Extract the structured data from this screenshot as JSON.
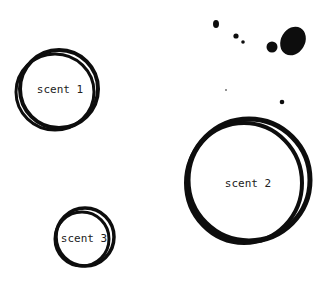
{
  "scents": [
    {
      "label": "scent 1"
    },
    {
      "label": "scent 2"
    },
    {
      "label": "scent 3"
    }
  ],
  "colors": {
    "ink": "#0d0d0d",
    "background": "#ffffff"
  }
}
